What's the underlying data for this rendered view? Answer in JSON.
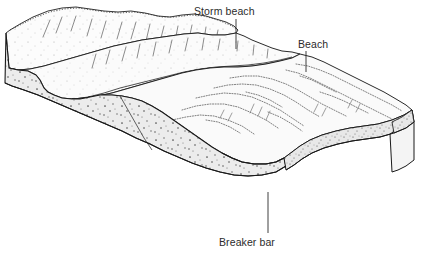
{
  "figure": {
    "type": "geological-block-diagram",
    "background_color": "#ffffff",
    "line_color": "#1a1a1a",
    "section_fill": "#ececec",
    "surface_fill": "#fbfbfb",
    "stipple_color": "#555555",
    "width": 444,
    "height": 255
  },
  "labels": [
    {
      "id": "storm-beach",
      "text": "Storm beach",
      "x": 194,
      "y": 5,
      "leader": {
        "x1": 236,
        "y1": 19,
        "x2": 236,
        "y2": 49
      }
    },
    {
      "id": "beach",
      "text": "Beach",
      "x": 298,
      "y": 38,
      "leader": {
        "x1": 306,
        "y1": 51,
        "x2": 306,
        "y2": 72
      }
    },
    {
      "id": "breaker-bar",
      "text": "Breaker bar",
      "x": 219,
      "y": 236,
      "leader": {
        "x1": 268,
        "y1": 192,
        "x2": 268,
        "y2": 233
      }
    }
  ],
  "features": [
    {
      "name": "dune-ridge",
      "description": "Undulating stippled dune crest along the far back edge"
    },
    {
      "name": "storm-beach-terrace",
      "description": "Raised sand terrace behind the beach"
    },
    {
      "name": "beach-face",
      "description": "Beach surface with swash ripple contours"
    },
    {
      "name": "breaker-bar",
      "description": "Submerged sand bar along the front slope"
    },
    {
      "name": "cross-section-left",
      "description": "Stippled sand cross-section on the left cut face"
    },
    {
      "name": "cross-section-front",
      "description": "Stippled sand band on the front cut face"
    },
    {
      "name": "cross-section-right",
      "description": "Stippled sand band on the right cut face"
    }
  ]
}
